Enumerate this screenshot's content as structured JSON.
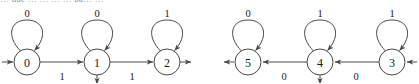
{
  "figure": {
    "kind": "finite-state-automaton-diagram",
    "cut_header_text": "… que … … … … pa… …",
    "stroke_color": "#4a4a4a",
    "text_color": "#1a1a1a",
    "background_color": "#ffffff",
    "node_radius": 13
  },
  "automata": [
    {
      "name": "left-automaton",
      "direction": "left-to-right",
      "entry_side": "left",
      "exit_side": "right",
      "states": [
        {
          "id": "0",
          "label": "0",
          "cx": 27,
          "cy": 62,
          "self_loop_label": "0",
          "has_down_arrow": false
        },
        {
          "id": "1",
          "label": "1",
          "cx": 97,
          "cy": 62,
          "self_loop_label": "0",
          "has_down_arrow": true
        },
        {
          "id": "2",
          "label": "2",
          "cx": 167,
          "cy": 62,
          "self_loop_label": "1",
          "has_down_arrow": false
        }
      ],
      "transitions": [
        {
          "from": "0",
          "to": "1",
          "label": "1",
          "label_x": 62,
          "label_y": 76
        },
        {
          "from": "1",
          "to": "2",
          "label": "1",
          "label_x": 132,
          "label_y": 76
        }
      ],
      "loop_labels": [
        {
          "state": "0",
          "text": "0",
          "x": 27,
          "y": 13
        },
        {
          "state": "1",
          "text": "0",
          "x": 97,
          "y": 13
        },
        {
          "state": "2",
          "text": "1",
          "x": 167,
          "y": 13
        }
      ]
    },
    {
      "name": "right-automaton",
      "direction": "right-to-left",
      "entry_side": "right",
      "exit_side": "left",
      "states": [
        {
          "id": "5",
          "label": "5",
          "cx": 248,
          "cy": 62,
          "self_loop_label": "0",
          "has_down_arrow": false
        },
        {
          "id": "4",
          "label": "4",
          "cx": 320,
          "cy": 62,
          "self_loop_label": "1",
          "has_down_arrow": true
        },
        {
          "id": "3",
          "label": "3",
          "cx": 392,
          "cy": 62,
          "self_loop_label": "1",
          "has_down_arrow": false
        }
      ],
      "transitions": [
        {
          "from": "4",
          "to": "5",
          "label": "0",
          "label_x": 284,
          "label_y": 76
        },
        {
          "from": "3",
          "to": "4",
          "label": "0",
          "label_x": 356,
          "label_y": 76
        }
      ],
      "loop_labels": [
        {
          "state": "5",
          "text": "0",
          "x": 248,
          "y": 13
        },
        {
          "state": "4",
          "text": "1",
          "x": 320,
          "y": 13
        },
        {
          "state": "3",
          "text": "1",
          "x": 392,
          "y": 13
        }
      ]
    }
  ]
}
